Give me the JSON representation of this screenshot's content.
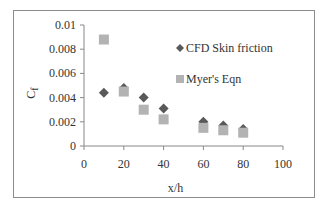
{
  "chart_data": {
    "type": "scatter",
    "title": "",
    "xlabel": "x/h",
    "ylabel": "C_f",
    "ylabel_main": "C",
    "ylabel_sub": "f",
    "xlim": [
      0,
      100
    ],
    "ylim": [
      0,
      0.01
    ],
    "xticks": [
      "0",
      "20",
      "40",
      "60",
      "80",
      "100"
    ],
    "yticks": [
      "0",
      "0.002",
      "0.004",
      "0.006",
      "0.008",
      "0.01"
    ],
    "grid": false,
    "legend_position": "upper right inside",
    "series": [
      {
        "name": "CFD Skin friction",
        "marker": "diamond",
        "color": "#595959",
        "x": [
          10,
          20,
          30,
          40,
          60,
          70,
          80
        ],
        "y": [
          0.0044,
          0.0048,
          0.004,
          0.0031,
          0.002,
          0.0017,
          0.0014
        ]
      },
      {
        "name": "Myer's Eqn",
        "marker": "square",
        "color": "#b3b3b3",
        "x": [
          10,
          20,
          30,
          40,
          60,
          70,
          80
        ],
        "y": [
          0.0088,
          0.0045,
          0.003,
          0.0022,
          0.0015,
          0.0013,
          0.0011
        ]
      }
    ]
  }
}
